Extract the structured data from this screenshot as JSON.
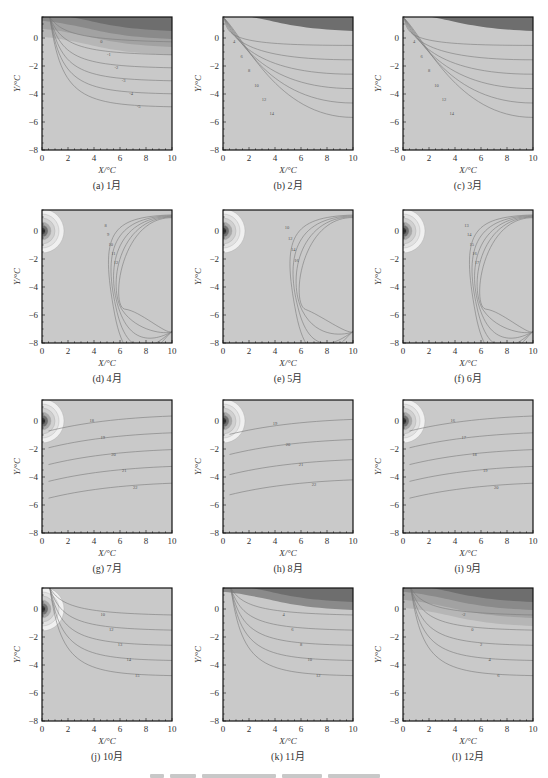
{
  "figure": {
    "caption_text_illegible": true
  },
  "chart_data": [
    {
      "id": "a",
      "type": "heatmap",
      "subplot": "contour",
      "caption": "(a) 1月",
      "xlabel": "X/°C",
      "ylabel": "Y/°C",
      "xlim": [
        0,
        10
      ],
      "ylim": [
        -8,
        1.5
      ],
      "xticks": [
        "0",
        "2",
        "4",
        "6",
        "8",
        "10"
      ],
      "yticks": [
        "0",
        "-2",
        "-4",
        "-6",
        "-8"
      ],
      "top_dark_bands": 4,
      "source_bulge": false,
      "contour_style": "horizontal-top",
      "labels": [
        "0",
        "-1",
        "-2",
        "-3",
        "-4",
        "-5"
      ]
    },
    {
      "id": "b",
      "type": "heatmap",
      "subplot": "contour",
      "caption": "(b) 2月",
      "xlabel": "X/°C",
      "ylabel": "Y/°C",
      "xlim": [
        0,
        10
      ],
      "ylim": [
        -8,
        1.5
      ],
      "xticks": [
        "0",
        "2",
        "4",
        "6",
        "8",
        "10"
      ],
      "yticks": [
        "0",
        "-2",
        "-4",
        "-6",
        "-8"
      ],
      "top_dark_bands": 1,
      "source_bulge": false,
      "contour_style": "fan-from-origin",
      "labels": [
        "4",
        "6",
        "8",
        "10",
        "12",
        "14"
      ]
    },
    {
      "id": "c",
      "type": "heatmap",
      "subplot": "contour",
      "caption": "(c) 3月",
      "xlabel": "X/°C",
      "ylabel": "Y/°C",
      "xlim": [
        0,
        10
      ],
      "ylim": [
        -8,
        1.5
      ],
      "xticks": [
        "0",
        "2",
        "4",
        "6",
        "8",
        "10"
      ],
      "yticks": [
        "0",
        "-2",
        "-4",
        "-6",
        "-8"
      ],
      "top_dark_bands": 1,
      "source_bulge": false,
      "contour_style": "fan-from-origin",
      "labels": [
        "4",
        "6",
        "8",
        "10",
        "12",
        "14"
      ]
    },
    {
      "id": "d",
      "type": "heatmap",
      "subplot": "contour",
      "caption": "(d) 4月",
      "xlabel": "X/°C",
      "ylabel": "Y/°C",
      "xlim": [
        0,
        10
      ],
      "ylim": [
        -8,
        1.5
      ],
      "xticks": [
        "0",
        "2",
        "4",
        "6",
        "8",
        "10"
      ],
      "yticks": [
        "0",
        "-2",
        "-4",
        "-6",
        "-8"
      ],
      "top_dark_bands": 0,
      "source_bulge": true,
      "contour_style": "open-right",
      "labels": [
        "8",
        "9",
        "10",
        "11",
        "12"
      ]
    },
    {
      "id": "e",
      "type": "heatmap",
      "subplot": "contour",
      "caption": "(e) 5月",
      "xlabel": "X/°C",
      "ylabel": "Y/°C",
      "xlim": [
        0,
        10
      ],
      "ylim": [
        -8,
        1.5
      ],
      "xticks": [
        "0",
        "2",
        "4",
        "6",
        "8",
        "10"
      ],
      "yticks": [
        "0",
        "-2",
        "-4",
        "-6",
        "-8"
      ],
      "top_dark_bands": 0,
      "source_bulge": true,
      "contour_style": "open-right",
      "labels": [
        "10",
        "12",
        "14",
        "16"
      ]
    },
    {
      "id": "f",
      "type": "heatmap",
      "subplot": "contour",
      "caption": "(f) 6月",
      "xlabel": "X/°C",
      "ylabel": "Y/°C",
      "xlim": [
        0,
        10
      ],
      "ylim": [
        -8,
        1.5
      ],
      "xticks": [
        "0",
        "2",
        "4",
        "6",
        "8",
        "10"
      ],
      "yticks": [
        "0",
        "-2",
        "-4",
        "-6",
        "-8"
      ],
      "top_dark_bands": 0,
      "source_bulge": true,
      "contour_style": "open-right",
      "labels": [
        "13",
        "14",
        "15",
        "16",
        "17"
      ]
    },
    {
      "id": "g",
      "type": "heatmap",
      "subplot": "contour",
      "caption": "(g) 7月",
      "xlabel": "X/°C",
      "ylabel": "Y/°C",
      "xlim": [
        0,
        10
      ],
      "ylim": [
        -8,
        1.5
      ],
      "xticks": [
        "0",
        "2",
        "4",
        "6",
        "8",
        "10"
      ],
      "yticks": [
        "0",
        "-2",
        "-4",
        "-6",
        "-8"
      ],
      "top_dark_bands": 0,
      "source_bulge": true,
      "contour_style": "horizontal-mid",
      "labels": [
        "18",
        "19",
        "20",
        "21",
        "22"
      ]
    },
    {
      "id": "h",
      "type": "heatmap",
      "subplot": "contour",
      "caption": "(h) 8月",
      "xlabel": "X/°C",
      "ylabel": "Y/°C",
      "xlim": [
        0,
        10
      ],
      "ylim": [
        -8,
        1.5
      ],
      "xticks": [
        "0",
        "2",
        "4",
        "6",
        "8",
        "10"
      ],
      "yticks": [
        "0",
        "-2",
        "-4",
        "-6",
        "-8"
      ],
      "top_dark_bands": 0,
      "source_bulge": true,
      "contour_style": "horizontal-mid",
      "labels": [
        "19",
        "20",
        "21",
        "22"
      ]
    },
    {
      "id": "i",
      "type": "heatmap",
      "subplot": "contour",
      "caption": "(i) 9月",
      "xlabel": "X/°C",
      "ylabel": "Y/°C",
      "xlim": [
        0,
        10
      ],
      "ylim": [
        -8,
        1.5
      ],
      "xticks": [
        "0",
        "2",
        "4",
        "6",
        "8",
        "10"
      ],
      "yticks": [
        "0",
        "-2",
        "-4",
        "-6",
        "-8"
      ],
      "top_dark_bands": 0,
      "source_bulge": true,
      "contour_style": "horizontal-mid",
      "labels": [
        "16",
        "17",
        "18",
        "19",
        "20"
      ]
    },
    {
      "id": "j",
      "type": "heatmap",
      "subplot": "contour",
      "caption": "(j) 10月",
      "xlabel": "X/°C",
      "ylabel": "Y/°C",
      "xlim": [
        0,
        10
      ],
      "ylim": [
        -8,
        1.5
      ],
      "xticks": [
        "0",
        "2",
        "4",
        "6",
        "8",
        "10"
      ],
      "yticks": [
        "0",
        "-2",
        "-4",
        "-6",
        "-8"
      ],
      "top_dark_bands": 0,
      "source_bulge": true,
      "contour_style": "horizontal-top",
      "labels": [
        "10",
        "12",
        "13",
        "14",
        "15"
      ]
    },
    {
      "id": "k",
      "type": "heatmap",
      "subplot": "contour",
      "caption": "(k) 11月",
      "xlabel": "X/°C",
      "ylabel": "Y/°C",
      "xlim": [
        0,
        10
      ],
      "ylim": [
        -8,
        1.5
      ],
      "xticks": [
        "0",
        "2",
        "4",
        "6",
        "8",
        "10"
      ],
      "yticks": [
        "0",
        "-2",
        "-4",
        "-6",
        "-8"
      ],
      "top_dark_bands": 2,
      "source_bulge": false,
      "contour_style": "horizontal-top",
      "labels": [
        "4",
        "6",
        "8",
        "10",
        "12"
      ]
    },
    {
      "id": "l",
      "type": "heatmap",
      "subplot": "contour",
      "caption": "(l) 12月",
      "xlabel": "X/°C",
      "ylabel": "Y/°C",
      "xlim": [
        0,
        10
      ],
      "ylim": [
        -8,
        1.5
      ],
      "xticks": [
        "0",
        "2",
        "4",
        "6",
        "8",
        "10"
      ],
      "yticks": [
        "0",
        "-2",
        "-4",
        "-6",
        "-8"
      ],
      "top_dark_bands": 4,
      "source_bulge": false,
      "contour_style": "horizontal-top",
      "labels": [
        "-2",
        "0",
        "2",
        "4",
        "6"
      ]
    }
  ]
}
